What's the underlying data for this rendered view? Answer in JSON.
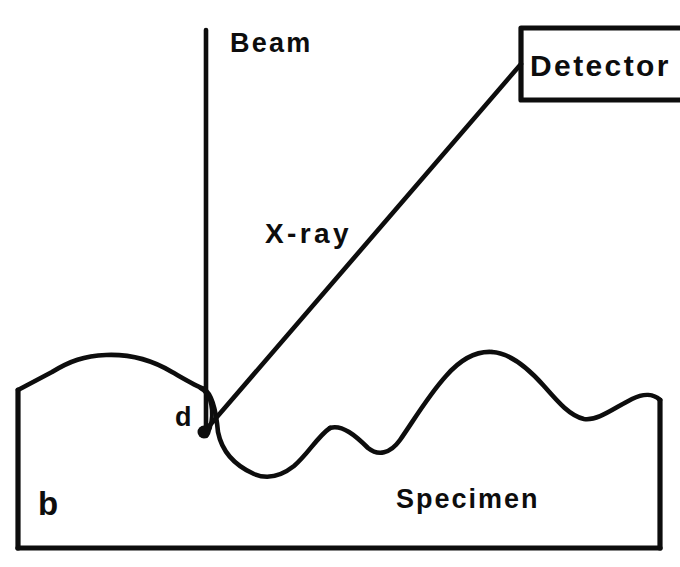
{
  "figure": {
    "panel_label": "b",
    "caption_type": "schematic-diagram",
    "background_color": "#ffffff",
    "line_color": "#0d0d0d",
    "labels": {
      "beam": "Beam",
      "detector": "Detector",
      "xray": "X-ray",
      "specimen": "Specimen",
      "depth": "d"
    },
    "elements": {
      "beam_line": {
        "name": "incident-electron-beam",
        "orientation": "vertical",
        "x": 206,
        "y_top": 30,
        "y_bottom": 436
      },
      "xray_line": {
        "name": "emitted-xray-path",
        "x1": 204,
        "y1": 432,
        "x2": 521,
        "y2": 64
      },
      "detector_box": {
        "name": "detector-housing",
        "left": 521,
        "top": 28,
        "bottom": 100,
        "right_open": true,
        "right_extent": 680
      },
      "interaction_point": {
        "name": "beam-specimen-interaction-volume",
        "x": 204,
        "y": 432,
        "radius": 6
      },
      "depth_marker": {
        "name": "penetration-depth-bracket",
        "x": 200,
        "y_top": 388,
        "y_bottom": 432,
        "label_x": 182,
        "label_y": 425
      },
      "specimen_body": {
        "name": "specimen-cross-section",
        "left_edge_x": 18,
        "right_edge_x": 660,
        "bottom_y": 548,
        "surface_type": "rough-irregular"
      }
    },
    "surface_profile_points": [
      [
        18,
        390
      ],
      [
        40,
        378
      ],
      [
        62,
        368
      ],
      [
        95,
        356
      ],
      [
        135,
        355
      ],
      [
        168,
        368
      ],
      [
        192,
        384
      ],
      [
        204,
        389
      ],
      [
        212,
        400
      ],
      [
        218,
        432
      ],
      [
        232,
        455
      ],
      [
        252,
        470
      ],
      [
        268,
        478
      ],
      [
        292,
        468
      ],
      [
        312,
        444
      ],
      [
        330,
        428
      ],
      [
        348,
        430
      ],
      [
        364,
        444
      ],
      [
        382,
        452
      ],
      [
        400,
        440
      ],
      [
        420,
        412
      ],
      [
        445,
        378
      ],
      [
        468,
        358
      ],
      [
        492,
        352
      ],
      [
        516,
        358
      ],
      [
        540,
        378
      ],
      [
        562,
        402
      ],
      [
        582,
        418
      ],
      [
        602,
        414
      ],
      [
        626,
        400
      ],
      [
        648,
        396
      ],
      [
        660,
        400
      ]
    ],
    "label_positions": {
      "beam": {
        "x": 230,
        "y": 52
      },
      "detector": {
        "x": 530,
        "y": 76
      },
      "xray": {
        "x": 265,
        "y": 243
      },
      "specimen": {
        "x": 396,
        "y": 508
      },
      "panel": {
        "x": 38,
        "y": 515
      }
    }
  }
}
